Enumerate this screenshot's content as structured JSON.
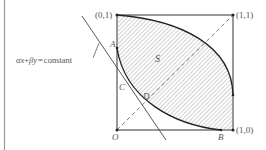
{
  "diagram": {
    "type": "geometric-region-diagram",
    "points": {
      "top_left": "(0,1)",
      "top_right": "(1,1)",
      "bottom_right": "(1,0)",
      "origin": "O",
      "A": "A",
      "B": "B",
      "C": "C",
      "D": "D"
    },
    "region_label": "S",
    "line_label": "αx+βy = constant",
    "line_label_parts": {
      "alpha": "α",
      "x": "x",
      "plus": "+",
      "beta": "β",
      "y": "y",
      "eq": "=",
      "constant": "constant"
    },
    "colors": {
      "stroke": "#333333",
      "hatch": "#9a9a9a",
      "label": "#555555",
      "dashed": "#666666"
    }
  }
}
